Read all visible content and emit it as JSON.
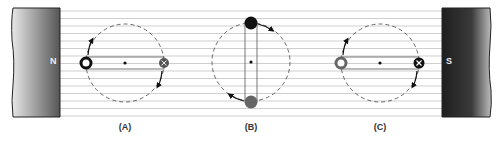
{
  "figure": {
    "magnets": {
      "left": {
        "pole": "N"
      },
      "right": {
        "pole": "S"
      }
    },
    "panels": [
      {
        "label": "(A)",
        "left_conductor": "dot (out of page)",
        "right_conductor": "cross (into page)",
        "orientation": "horizontal"
      },
      {
        "label": "(B)",
        "top_conductor": "solid",
        "bottom_conductor": "solid grey",
        "orientation": "vertical"
      },
      {
        "label": "(C)",
        "left_conductor": "dot (out of page)",
        "right_conductor": "cross (into page)",
        "orientation": "horizontal"
      }
    ],
    "colors": {
      "field_line": "#c8c8c8",
      "conductor_dark": "#111111",
      "conductor_grey": "#666666",
      "magnet_dark": "#2a2a2a",
      "magnet_light": "#e6e6e6"
    }
  }
}
